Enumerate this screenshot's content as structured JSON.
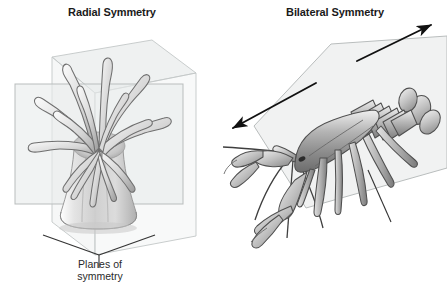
{
  "figure": {
    "background_color": "#ffffff",
    "ink_color": "#1a1a1a",
    "plane_fill_color": "#e9ebeb",
    "plane_stroke_color": "#b9bdbd",
    "organism_light": "#f2f2f2",
    "organism_mid": "#b7b7b7",
    "organism_dark": "#6e6e6e",
    "leader_line_color": "#333333"
  },
  "panels": [
    {
      "id": "radial",
      "title": "Radial Symmetry",
      "organism": "sea-anemone",
      "planes_count": 2,
      "caption": "Planes of\nsymmetry",
      "caption_lines": [
        "Planes of",
        "symmetry"
      ],
      "leader_style": "v-shaped-two-branch"
    },
    {
      "id": "bilateral",
      "title": "Bilateral Symmetry",
      "organism": "lobster",
      "planes_count": 1,
      "caption": "Plane of\nsymmetry",
      "caption_lines": [
        "Plane of",
        "symmetry"
      ],
      "leader_style": "single-line",
      "arrows": [
        {
          "name": "axis-arrow-lower-left",
          "direction": "down-left"
        },
        {
          "name": "axis-arrow-upper-right",
          "direction": "up-right"
        }
      ]
    }
  ]
}
